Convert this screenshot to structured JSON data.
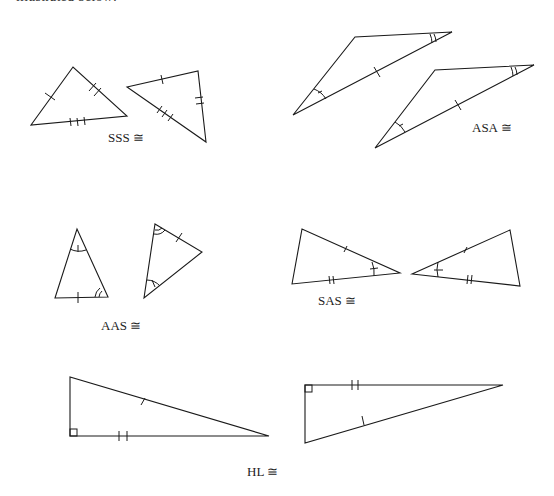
{
  "page": {
    "top_caption": "illustrated below:"
  },
  "figures": {
    "sss": {
      "label": "SSS ≅"
    },
    "asa": {
      "label": "ASA ≅"
    },
    "aas": {
      "label": "AAS ≅"
    },
    "sas": {
      "label": "SAS ≅"
    },
    "hl": {
      "label": "HL ≅"
    }
  },
  "colors": {
    "stroke": "#1a1a1a",
    "text": "#222222",
    "background": "#ffffff"
  }
}
